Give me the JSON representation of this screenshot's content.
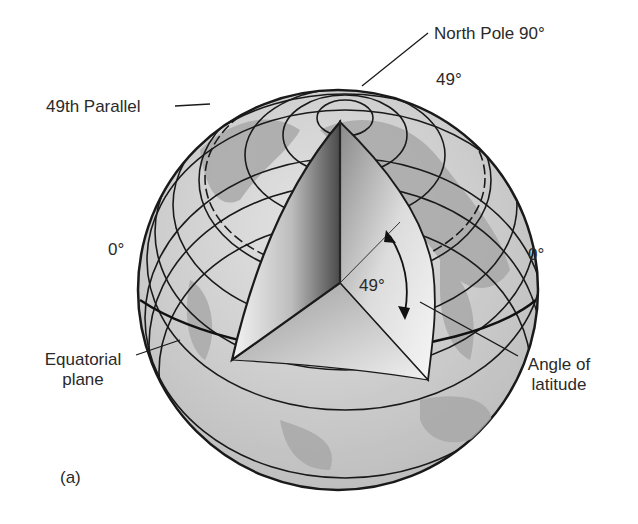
{
  "figure": {
    "panel_label": "(a)",
    "colors": {
      "outline": "#1a1a1a",
      "globe_fill": "#cfcfcf",
      "land_fill": "#a8a8a8",
      "cut_light": "#f2f2f2",
      "cut_dark": "#5a5a5a",
      "background": "#ffffff"
    }
  },
  "labels": {
    "north_pole": "North Pole 90°",
    "forty_nine_top": "49°",
    "forty_ninth_parallel": "49th Parallel",
    "zero_left": "0°",
    "zero_right": "0°",
    "angle_value": "49°",
    "equatorial_line1": "Equatorial",
    "equatorial_line2": "plane",
    "angle_line1": "Angle of",
    "angle_line2": "latitude"
  }
}
